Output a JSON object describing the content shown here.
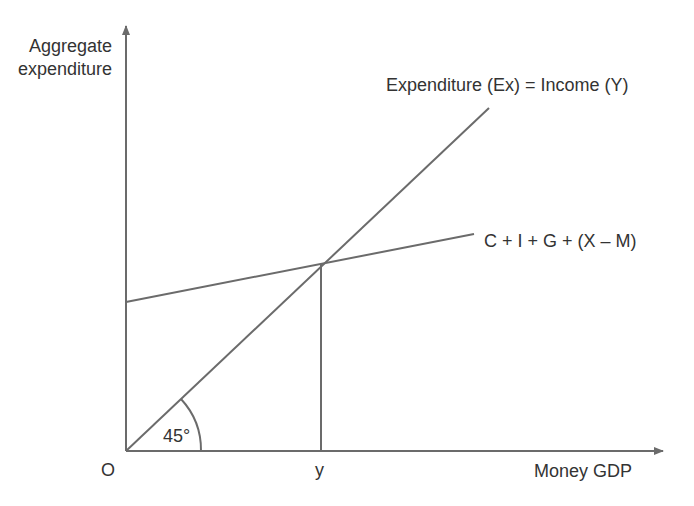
{
  "diagram": {
    "type": "keynesian-cross",
    "y_axis_label": [
      "Aggregate",
      "expenditure"
    ],
    "x_axis_label": "Money GDP",
    "origin_label": "O",
    "equilibrium_label": "y",
    "angle_label": "45°",
    "lines": [
      {
        "name": "Expenditure (Ex) = Income (Y)",
        "label": "Expenditure (Ex) = Income (Y)",
        "slope_deg": 45
      },
      {
        "name": "C + I + G + (X – M)",
        "label": "C + I + G + (X – M)"
      }
    ],
    "colors": {
      "line": "#6b6b6b",
      "text": "#333333",
      "background": "#ffffff"
    }
  }
}
